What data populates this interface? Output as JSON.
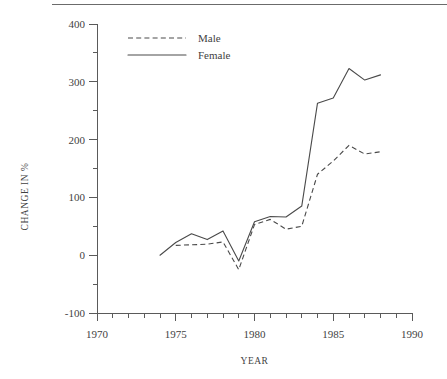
{
  "chart_data": {
    "type": "line",
    "title": "",
    "xlabel": "YEAR",
    "ylabel": "CHANGE IN %",
    "xlim": [
      1970,
      1990
    ],
    "ylim": [
      -100,
      400
    ],
    "x_major_ticks": [
      1970,
      1975,
      1980,
      1985,
      1990
    ],
    "x_tick_labels": [
      "1970",
      "1975",
      "1980",
      "1985",
      "1990"
    ],
    "x_minor_tick_step": 1,
    "y_major_ticks": [
      -100,
      0,
      100,
      200,
      300,
      400
    ],
    "y_tick_labels": [
      "-100",
      "0",
      "100",
      "200",
      "300",
      "400"
    ],
    "y_minor_tick_step": 50,
    "grid": false,
    "legend_position": "top-left-inside",
    "series": [
      {
        "name": "Male",
        "style": "dashed",
        "color": "#4a4a4a",
        "x": [
          1975,
          1976,
          1977,
          1978,
          1979,
          1980,
          1981,
          1982,
          1983,
          1984,
          1985,
          1986,
          1987,
          1988
        ],
        "values": [
          17,
          18,
          19,
          23,
          -25,
          53,
          62,
          45,
          50,
          140,
          163,
          190,
          175,
          179
        ]
      },
      {
        "name": "Female",
        "style": "solid",
        "color": "#4a4a4a",
        "x": [
          1974,
          1975,
          1976,
          1977,
          1978,
          1979,
          1980,
          1981,
          1982,
          1983,
          1984,
          1985,
          1986,
          1987,
          1988
        ],
        "values": [
          0,
          22,
          37,
          27,
          42,
          -10,
          58,
          67,
          66,
          85,
          263,
          272,
          323,
          303,
          312
        ]
      }
    ]
  },
  "legend": {
    "entries": [
      {
        "label": "Male"
      },
      {
        "label": "Female"
      }
    ]
  },
  "axes": {
    "y_title": "CHANGE IN %",
    "x_title": "YEAR"
  }
}
